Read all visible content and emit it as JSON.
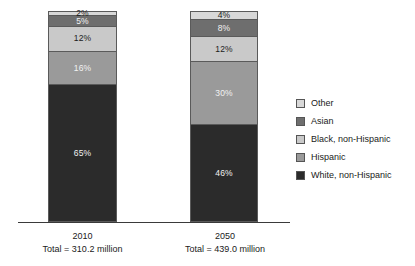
{
  "chart_data": {
    "type": "bar",
    "subtype": "stacked-100-percent",
    "title": "",
    "subtitle": "",
    "xlabel": "",
    "ylabel": "",
    "ylim": [
      0,
      100
    ],
    "grid": false,
    "legend_position": "right",
    "categories": [
      "2010",
      "2050"
    ],
    "category_captions": [
      "Total = 310.2 million",
      "Total = 439.0 million"
    ],
    "series": [
      {
        "name": "Other",
        "color": "#d8d8d8",
        "values": [
          2,
          4
        ],
        "value_labels": [
          "2%",
          "4%"
        ]
      },
      {
        "name": "Asian",
        "color": "#6e6e6e",
        "values": [
          5,
          8
        ],
        "value_labels": [
          "5%",
          "8%"
        ]
      },
      {
        "name": "Black, non-Hispanic",
        "color": "#c9c9c9",
        "values": [
          12,
          12
        ],
        "value_labels": [
          "12%",
          "12%"
        ]
      },
      {
        "name": "Hispanic",
        "color": "#9a9a9a",
        "values": [
          16,
          30
        ],
        "value_labels": [
          "16%",
          "30%"
        ]
      },
      {
        "name": "White, non-Hispanic",
        "color": "#2b2b2b",
        "values": [
          65,
          46
        ],
        "value_labels": [
          "65%",
          "46%"
        ]
      }
    ],
    "stack_order_top_to_bottom": [
      "Other",
      "Asian",
      "Black, non-Hispanic",
      "Hispanic",
      "White, non-Hispanic"
    ]
  },
  "bars": {
    "b2010": {
      "year": "2010",
      "total": "Total = 310.2 million",
      "segments": [
        {
          "label": "2%",
          "name": "Other"
        },
        {
          "label": "5%",
          "name": "Asian"
        },
        {
          "label": "12%",
          "name": "Black, non-Hispanic"
        },
        {
          "label": "16%",
          "name": "Hispanic"
        },
        {
          "label": "65%",
          "name": "White, non-Hispanic"
        }
      ]
    },
    "b2050": {
      "year": "2050",
      "total": "Total = 439.0 million",
      "segments": [
        {
          "label": "4%",
          "name": "Other"
        },
        {
          "label": "8%",
          "name": "Asian"
        },
        {
          "label": "12%",
          "name": "Black, non-Hispanic"
        },
        {
          "label": "30%",
          "name": "Hispanic"
        },
        {
          "label": "46%",
          "name": "White, non-Hispanic"
        }
      ]
    }
  },
  "legend": {
    "items": [
      {
        "label": "Other",
        "color": "#d8d8d8"
      },
      {
        "label": "Asian",
        "color": "#6e6e6e"
      },
      {
        "label": "Black, non-Hispanic",
        "color": "#c9c9c9"
      },
      {
        "label": "Hispanic",
        "color": "#9a9a9a"
      },
      {
        "label": "White, non-Hispanic",
        "color": "#2b2b2b"
      }
    ]
  }
}
